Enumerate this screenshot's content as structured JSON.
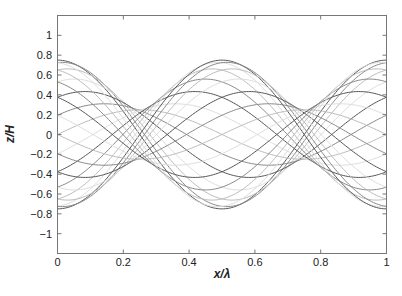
{
  "chart_data": {
    "type": "line",
    "title": "",
    "xlabel": "x/λ",
    "ylabel": "z/H",
    "xlim": [
      0,
      1
    ],
    "ylim": [
      -1.2,
      1.2
    ],
    "grid": false,
    "legend": null,
    "x_ticks": [
      0,
      0.2,
      0.4,
      0.6,
      0.8,
      1
    ],
    "x_tick_labels": [
      "0",
      "0.2",
      "0.4",
      "0.6",
      "0.8",
      "1"
    ],
    "y_ticks": [
      1,
      0.8,
      0.6,
      0.4,
      0.2,
      0,
      -0.2,
      -0.4,
      -0.6,
      -0.8,
      -1
    ],
    "y_tick_labels": [
      "1",
      "0.8",
      "0.6",
      "0.4",
      "0.2",
      "0",
      "−0.2",
      "−0.4",
      "−0.6",
      "−0.8",
      "−1"
    ],
    "model": {
      "description": "Partial standing wave snapshots: z/H = 0.5[cos(2πx/λ − θ) + R·cos(2πx/λ + θ)]",
      "reflection_coefficient": 0.5,
      "incident_amplitude": 0.5,
      "phase_count": 24,
      "envelope_max": 0.75,
      "envelope_min": 0.25
    },
    "series_colors": [
      "#555555",
      "#888888",
      "#bbbbbb",
      "#dddddd"
    ],
    "envelope_points": {
      "x": [
        0,
        0.25,
        0.5,
        0.75,
        1
      ],
      "upper": [
        0.75,
        0.25,
        0.75,
        0.25,
        0.75
      ],
      "lower": [
        -0.75,
        -0.25,
        -0.75,
        -0.25,
        -0.75
      ]
    }
  }
}
